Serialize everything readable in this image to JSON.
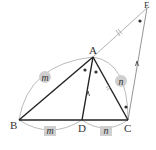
{
  "diagram": {
    "points": {
      "A": {
        "label": "A",
        "x": 93,
        "y": 57
      },
      "B": {
        "label": "B",
        "x": 19,
        "y": 120
      },
      "C": {
        "label": "C",
        "x": 128,
        "y": 120
      },
      "D": {
        "label": "D",
        "x": 82,
        "y": 120
      },
      "E": {
        "label": "E",
        "x": 147,
        "y": 8
      }
    },
    "segment_labels": {
      "AB": "m",
      "BD": "m",
      "AC": "n",
      "DC": "n"
    },
    "colors": {
      "triangle_stroke": "#222222",
      "construction_stroke": "#aaaaaa",
      "label_bg": "#cfcfcf",
      "text": "#333333",
      "dot": "#333333"
    }
  }
}
